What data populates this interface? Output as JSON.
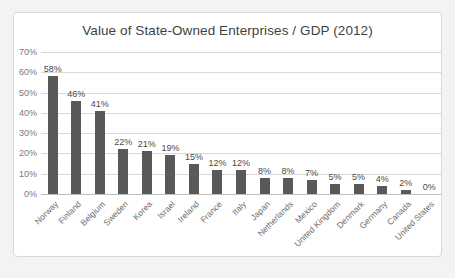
{
  "chart_data": {
    "type": "bar",
    "title": "Value of State-Owned Enterprises / GDP (2012)",
    "xlabel": "",
    "ylabel": "",
    "ylim": [
      0,
      70
    ],
    "ytick_labels": [
      "0%",
      "10%",
      "20%",
      "30%",
      "40%",
      "50%",
      "60%",
      "70%"
    ],
    "ytick_values": [
      0,
      10,
      20,
      30,
      40,
      50,
      60,
      70
    ],
    "grid": "horizontal",
    "legend": "none",
    "bar_color": "#595959",
    "gridline_color": "#d9d9d9",
    "categories": [
      "Norway",
      "Finland",
      "Belgium",
      "Sweden",
      "Korea",
      "Israel",
      "Ireland",
      "France",
      "Italy",
      "Japan",
      "Netherlands",
      "Mexico",
      "United Kingdom",
      "Denmark",
      "Germany",
      "Canada",
      "United States"
    ],
    "values": [
      58,
      46,
      41,
      22,
      21,
      19,
      15,
      12,
      12,
      8,
      8,
      7,
      5,
      5,
      4,
      2,
      0
    ],
    "data_labels": [
      "58%",
      "46%",
      "41%",
      "22%",
      "21%",
      "19%",
      "15%",
      "12%",
      "12%",
      "8%",
      "8%",
      "7%",
      "5%",
      "5%",
      "4%",
      "2%",
      "0%"
    ]
  }
}
